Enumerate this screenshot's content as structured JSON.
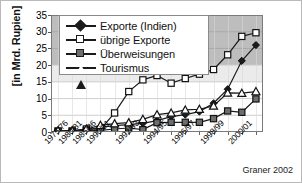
{
  "figure": {
    "credit": "Graner 2002",
    "y_axis_title": "[in Mrd. Rupien]"
  },
  "legend": {
    "items": [
      {
        "label": "Exporte (Indien)",
        "marker": "filled-diamond",
        "color": "#1c1c1c"
      },
      {
        "label": "übrige Exporte",
        "marker": "open-square",
        "color": "#ffffff"
      },
      {
        "label": "Überweisungen",
        "marker": "filled-square",
        "color": "#6e6e6e"
      },
      {
        "label": "Tourismus",
        "marker": "open-triangle",
        "color": "#ffffff"
      }
    ]
  },
  "chart_data": {
    "type": "line",
    "title": "",
    "subtitle": "",
    "xlabel": "",
    "ylabel": "[in Mrd. Rupien]",
    "ylim": [
      0,
      35
    ],
    "yticks": [
      0,
      5,
      10,
      15,
      20,
      25,
      30,
      35
    ],
    "grid": true,
    "legend_position": "top-left-inside",
    "annotations": [
      "Graner 2002"
    ],
    "x": [
      "1975/76",
      "1980/81",
      "1985/86",
      "1990/91",
      "1991/92",
      "1992/93",
      "1993/94",
      "1994/95",
      "1995/96",
      "1996/97",
      "1997/98",
      "1998/99",
      "1999/00",
      "2000/01",
      "2001/02"
    ],
    "xtick_labels": [
      "1975/76",
      "1980/81",
      "1985/86",
      "1990/91",
      "1992/93",
      "1994/95",
      "1996/97",
      "1998/99",
      "2000/01"
    ],
    "xtick_label_indices": [
      0,
      1,
      2,
      3,
      5,
      7,
      9,
      11,
      13
    ],
    "series": [
      {
        "name": "Exporte (Indien)",
        "marker": "filled-diamond",
        "values": [
          0.3,
          0.3,
          0.6,
          1.4,
          1.9,
          2.2,
          2.6,
          3.4,
          4.6,
          5.2,
          6.1,
          8.6,
          12.8,
          21.3,
          26.0
        ]
      },
      {
        "name": "übrige Exporte",
        "marker": "open-square",
        "values": [
          0.3,
          0.3,
          0.9,
          0.8,
          5.7,
          12.1,
          15.6,
          16.9,
          14.6,
          16.0,
          17.3,
          18.7,
          23.1,
          28.6,
          29.7
        ]
      },
      {
        "name": "Überweisungen",
        "marker": "filled-square",
        "values": [
          0.2,
          0.2,
          0.4,
          0.5,
          0.9,
          1.2,
          0.7,
          2.8,
          2.9,
          2.9,
          2.9,
          4.0,
          6.3,
          5.9,
          9.9
        ]
      },
      {
        "name": "Tourismus",
        "marker": "open-triangle",
        "values": [
          0.4,
          0.4,
          0.9,
          2.0,
          2.5,
          2.8,
          3.8,
          5.2,
          5.7,
          6.6,
          6.8,
          7.8,
          11.7,
          11.6,
          12.1
        ]
      }
    ]
  }
}
